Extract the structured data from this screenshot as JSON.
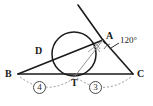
{
  "figure": {
    "kind": "geometry-diagram",
    "background_color": "#ffffff",
    "stroke_color": "#1a1a1a",
    "thin_stroke_color": "#7a7a7a",
    "dash_color": "#8a8a8a"
  },
  "points": {
    "A": {
      "label": "A",
      "x": 103,
      "y": 40,
      "label_x": 106,
      "label_y": 32
    },
    "B": {
      "label": "B",
      "x": 18,
      "y": 74,
      "label_x": 6,
      "label_y": 70
    },
    "C": {
      "label": "C",
      "x": 133,
      "y": 74,
      "label_x": 137,
      "label_y": 70
    },
    "D": {
      "label": "D",
      "x": 43,
      "y": 53,
      "label_x": 36,
      "label_y": 47
    },
    "T": {
      "label": "T",
      "x": 75,
      "y": 76,
      "label_x": 72,
      "label_y": 79
    }
  },
  "circle": {
    "cx": 74,
    "cy": 54,
    "r": 22
  },
  "tangent_line": {
    "x1": 78,
    "y1": 5,
    "x2": 121,
    "y2": 80
  },
  "angle": {
    "label": "120°",
    "value": 120,
    "unit": "degrees",
    "label_x": 121,
    "label_y": 39,
    "leader": {
      "x1": 119,
      "y1": 44,
      "x2": 112,
      "y2": 48
    }
  },
  "segments": [
    {
      "name": "BT",
      "label": "4",
      "label_x": 39,
      "label_y": 85
    },
    {
      "name": "TC",
      "label": "3",
      "label_x": 95,
      "label_y": 85
    }
  ]
}
